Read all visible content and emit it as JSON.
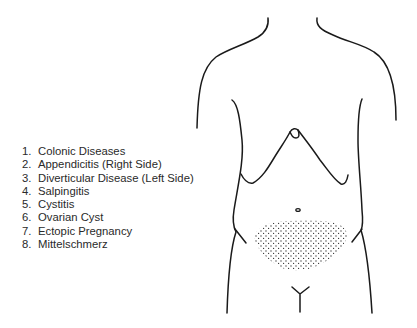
{
  "diagram": {
    "title": "",
    "highlighted_region": "lower-abdomen-suprapubic-stippled",
    "colors": {
      "line": "#1a1a1a",
      "stipple": "#333333",
      "text": "#2a2a2a",
      "background": "#ffffff"
    }
  },
  "legend": {
    "items": [
      {
        "num": "1.",
        "label": "Colonic Diseases"
      },
      {
        "num": "2.",
        "label": "Appendicitis (Right Side)"
      },
      {
        "num": "3.",
        "label": "Diverticular Disease (Left Side)"
      },
      {
        "num": "4.",
        "label": "Salpingitis"
      },
      {
        "num": "5.",
        "label": "Cystitis"
      },
      {
        "num": "6.",
        "label": "Ovarian Cyst"
      },
      {
        "num": "7.",
        "label": "Ectopic Pregnancy"
      },
      {
        "num": "8.",
        "label": "Mittelschmerz"
      }
    ]
  }
}
